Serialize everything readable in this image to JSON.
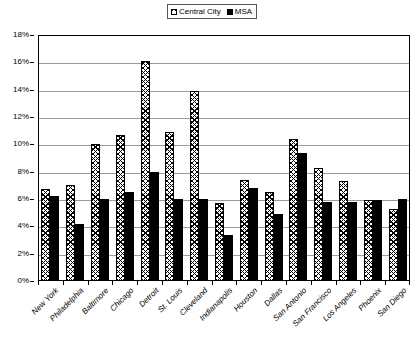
{
  "legend": {
    "position": "top-center",
    "entries": [
      {
        "label": "Central City",
        "swatch": "hatch-swatch"
      },
      {
        "label": "MSA",
        "swatch": "solid-black-swatch"
      }
    ]
  },
  "chart_data": {
    "type": "bar",
    "title": "",
    "subtitle": "",
    "xlabel": "",
    "ylabel": "",
    "ylim": [
      0,
      18
    ],
    "ytick_labels": [
      "0%",
      "2%",
      "4%",
      "6%",
      "8%",
      "10%",
      "12%",
      "14%",
      "16%",
      "18%"
    ],
    "ytick_values": [
      0,
      2,
      4,
      6,
      8,
      10,
      12,
      14,
      16,
      18
    ],
    "grid": true,
    "legend_position": "top-center",
    "categories": [
      "New York",
      "Philadelphia",
      "Baltimore",
      "Chicago",
      "Detroit",
      "St. Louis",
      "Cleveland",
      "Indianapolis",
      "Houston",
      "Dallas",
      "San Antonio",
      "San Francisco",
      "Los Angeles",
      "Phoenix",
      "San Diego"
    ],
    "series": [
      {
        "name": "Central City",
        "values": [
          6.7,
          7.0,
          10.0,
          10.7,
          16.1,
          10.9,
          13.9,
          5.7,
          7.4,
          6.5,
          10.4,
          8.3,
          7.3,
          5.9,
          5.3
        ]
      },
      {
        "name": "MSA",
        "values": [
          6.2,
          4.2,
          6.0,
          6.5,
          8.0,
          6.0,
          6.0,
          3.4,
          6.8,
          4.9,
          9.4,
          5.8,
          5.8,
          5.9,
          6.0
        ]
      }
    ]
  },
  "colors": {
    "series_central_city": "#ffffff",
    "series_msa": "#000000",
    "gridline": "#9a9a9a",
    "axis": "#000000",
    "background": "#ffffff"
  }
}
